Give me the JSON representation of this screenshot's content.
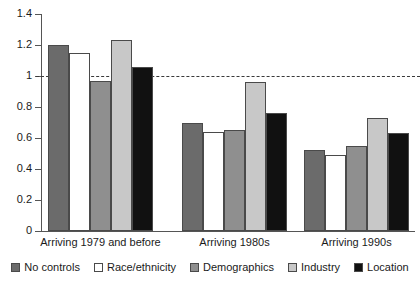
{
  "chart_data": {
    "type": "bar",
    "title": "",
    "subtitle": "",
    "xlabel": "",
    "ylabel": "",
    "ylim": [
      0,
      1.4
    ],
    "yticks": [
      "0",
      "0.2",
      "0.4",
      "0.6",
      "0.8",
      "1",
      "1.2",
      "1.4"
    ],
    "ytick_values": [
      0,
      0.2,
      0.4,
      0.6,
      0.8,
      1,
      1.2,
      1.4
    ],
    "grid": false,
    "legend_position": "bottom",
    "reference_line": {
      "axis": "y",
      "value": 1,
      "style": "dashed",
      "color": "#3a3a3a"
    },
    "categories": [
      "Arriving 1979 and before",
      "Arriving 1980s",
      "Arriving 1990s"
    ],
    "series": [
      {
        "name": "No controls",
        "color": "#6b6b6b",
        "values": [
          1.2,
          0.7,
          0.52
        ]
      },
      {
        "name": "Race/ethnicity",
        "color": "#ffffff",
        "values": [
          1.15,
          0.64,
          0.49
        ]
      },
      {
        "name": "Demographics",
        "color": "#8f8f8f",
        "values": [
          0.97,
          0.65,
          0.55
        ]
      },
      {
        "name": "Industry",
        "color": "#c8c8c8",
        "values": [
          1.23,
          0.96,
          0.73
        ]
      },
      {
        "name": "Location",
        "color": "#111111",
        "values": [
          1.06,
          0.76,
          0.63
        ]
      }
    ]
  },
  "legend": {
    "items": [
      {
        "label": "No controls",
        "color": "#6b6b6b"
      },
      {
        "label": "Race/ethnicity",
        "color": "#ffffff"
      },
      {
        "label": "Demographics",
        "color": "#8f8f8f"
      },
      {
        "label": "Industry",
        "color": "#c8c8c8"
      },
      {
        "label": "Location",
        "color": "#111111"
      }
    ]
  },
  "colors": {
    "axis": "#555555",
    "bar_outline": "#4a4a4a",
    "text": "#1a1a1a",
    "background": "#ffffff",
    "reference_line": "#3a3a3a"
  }
}
